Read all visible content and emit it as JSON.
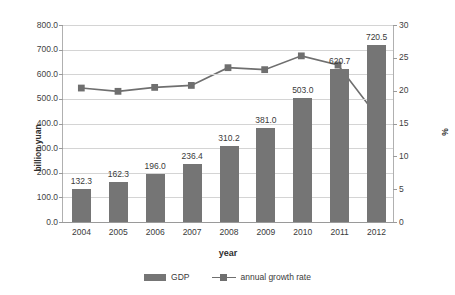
{
  "chart_data": {
    "type": "bar",
    "title": "",
    "categories": [
      "2004",
      "2005",
      "2006",
      "2007",
      "2008",
      "2009",
      "2010",
      "2011",
      "2012"
    ],
    "xlabel": "year",
    "ylabel": "billion yuan",
    "ylabel_secondary": "%",
    "ylim": [
      0,
      800
    ],
    "ylim_secondary": [
      0,
      30
    ],
    "yticks": [
      "0.0",
      "100.0",
      "200.0",
      "300.0",
      "400.0",
      "500.0",
      "600.0",
      "700.0",
      "800.0"
    ],
    "yticks_secondary": [
      "0",
      "5",
      "10",
      "15",
      "20",
      "25",
      "30"
    ],
    "grid": true,
    "legend_position": "bottom",
    "series": [
      {
        "name": "GDP",
        "type": "bar",
        "axis": "left",
        "color": "#757575",
        "values": [
          132.3,
          162.3,
          196.0,
          236.4,
          310.2,
          381.0,
          503.0,
          620.7,
          720.5
        ],
        "labels": [
          "132.3",
          "162.3",
          "196.0",
          "236.4",
          "310.2",
          "381.0",
          "503.0",
          "620.7",
          "720.5"
        ]
      },
      {
        "name": "annual growth rate",
        "type": "line",
        "axis": "right",
        "color": "#6f6f6f",
        "values": [
          20.4,
          19.9,
          20.5,
          20.8,
          23.5,
          23.2,
          25.3,
          23.9,
          16.6
        ]
      }
    ]
  },
  "legend": {
    "items": [
      {
        "label": "GDP"
      },
      {
        "label": "annual growth rate"
      }
    ]
  }
}
